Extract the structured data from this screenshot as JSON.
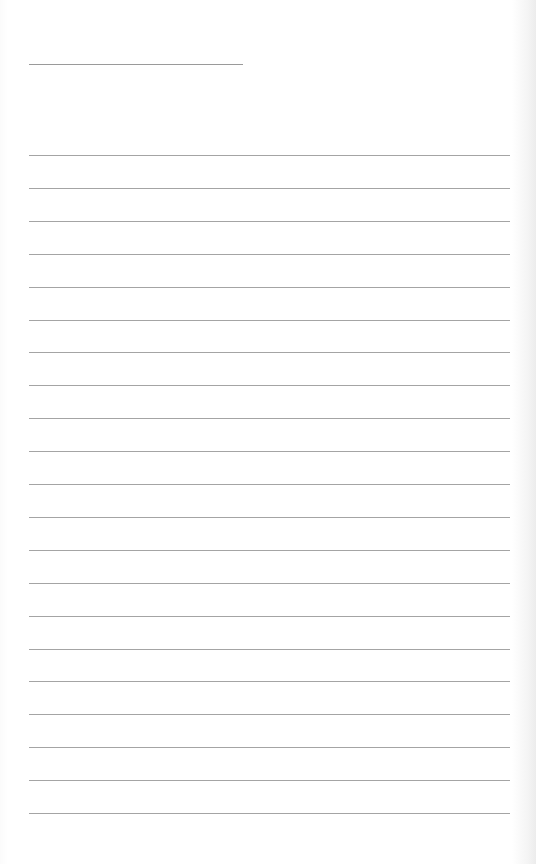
{
  "document": {
    "type": "lined-paper",
    "header_line": {
      "top": 64,
      "left": 29,
      "width": 214,
      "color": "#9a9a9a"
    },
    "ruled_lines": {
      "count": 21,
      "first_top": 155,
      "spacing": 32.9,
      "left": 29,
      "width": 481,
      "color": "#a4a4a4"
    },
    "paper_color": "#ffffff"
  }
}
